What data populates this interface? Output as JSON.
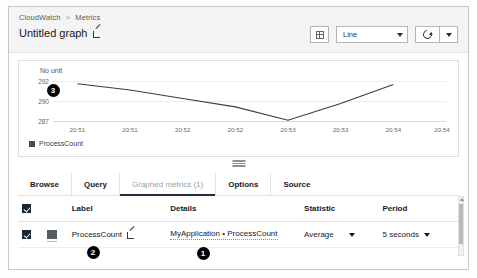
{
  "header": {
    "breadcrumb": {
      "root": "CloudWatch",
      "separator": ">",
      "current": "Metrics"
    },
    "graph_title": "Untitled graph",
    "edit_icon": "edit-pencil-icon",
    "layout_button_icon": "grid-layout-icon",
    "chart_type": "Line",
    "refresh_icon": "refresh-icon"
  },
  "chart_data": {
    "type": "line",
    "title": "",
    "unit_label": "No unit",
    "xlabel": "",
    "ylabel": "",
    "grid": true,
    "legend_position": "bottom-left",
    "yticks": [
      "292",
      "290",
      "287"
    ],
    "ylim": [
      287,
      292.6
    ],
    "categories": [
      "20:51",
      "20:51",
      "20:52",
      "20:52",
      "20:53",
      "20:53",
      "20:54",
      "20:54"
    ],
    "series": [
      {
        "name": "ProcessCount",
        "color": "#4a4a4a",
        "x": [
          "20:51",
          "20:51",
          "20:52",
          "20:52",
          "20:53",
          "20:53",
          "20:54",
          "20:54"
        ],
        "values": [
          292.2,
          291.3,
          290.1,
          288.9,
          287.0,
          289.4,
          292.1,
          null
        ]
      }
    ],
    "legend": [
      "ProcessCount"
    ]
  },
  "resize_grip": "resize-grip-icon",
  "tabs": [
    {
      "label": "Browse",
      "active": false
    },
    {
      "label": "Query",
      "active": false
    },
    {
      "label": "Graphed metrics (1)",
      "active": true
    },
    {
      "label": "Options",
      "active": false
    },
    {
      "label": "Source",
      "active": false
    }
  ],
  "table": {
    "headers": {
      "select_all": "",
      "label": "Label",
      "details": "Details",
      "statistic": "Statistic",
      "period": "Period"
    },
    "rows": [
      {
        "checked": true,
        "swatch_color": "#555c63",
        "label": "ProcessCount",
        "label_edit_icon": "edit-pencil-icon",
        "details": "MyApplication • ProcessCount",
        "statistic": "Average",
        "period": "5 seconds"
      }
    ]
  },
  "annotations": [
    {
      "number": "1",
      "x": 203,
      "y": 253
    },
    {
      "number": "2",
      "x": 93,
      "y": 252
    },
    {
      "number": "3",
      "x": 53,
      "y": 90
    }
  ]
}
